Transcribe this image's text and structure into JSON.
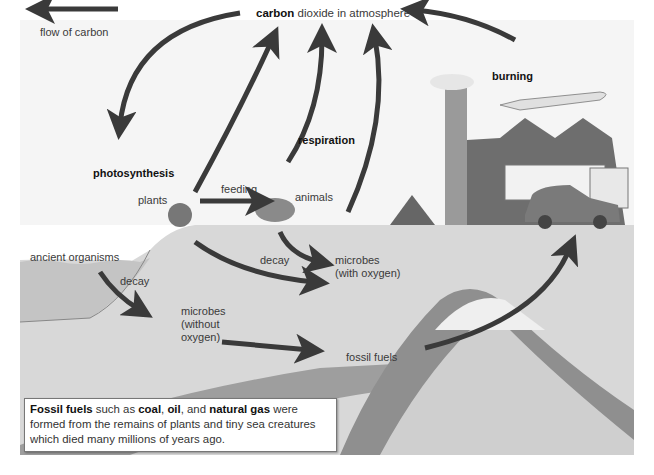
{
  "diagram": {
    "legend": {
      "arrow_label": "flow of carbon",
      "icon": "arrow-left-icon"
    },
    "atmosphere": {
      "bold": "carbon",
      "rest": " dioxide in atmosphere"
    },
    "labels": {
      "photosynthesis": "photosynthesis",
      "respiration": "respiration",
      "burning": "burning",
      "plants": "plants",
      "feeding": "feeding",
      "animals": "animals",
      "decay_surface": "decay",
      "microbes_oxygen_1": "microbes",
      "microbes_oxygen_2": "(with oxygen)",
      "ancient_organisms": "ancient organisms",
      "decay_ancient": "decay",
      "microbes_no_oxygen_1": "microbes",
      "microbes_no_oxygen_2": "(without",
      "microbes_no_oxygen_3": "oxygen)",
      "fossil_fuels": "fossil fuels"
    },
    "callout": {
      "b1": "Fossil fuels",
      "t1": " such as ",
      "b2": "coal",
      "t2": ", ",
      "b3": "oil",
      "t3": ", and ",
      "b4": "natural gas",
      "t4": " were formed from the remains of plants and tiny sea creatures which died many millions of years ago."
    },
    "colors": {
      "sky": "#f7f7f7",
      "ground": "#dcdcdc",
      "sea": "#c9c9c9",
      "fossil_layer": "#9a9a9a",
      "rock_layer": "#8c8c8c",
      "arrow": "#3a3a3a"
    }
  }
}
